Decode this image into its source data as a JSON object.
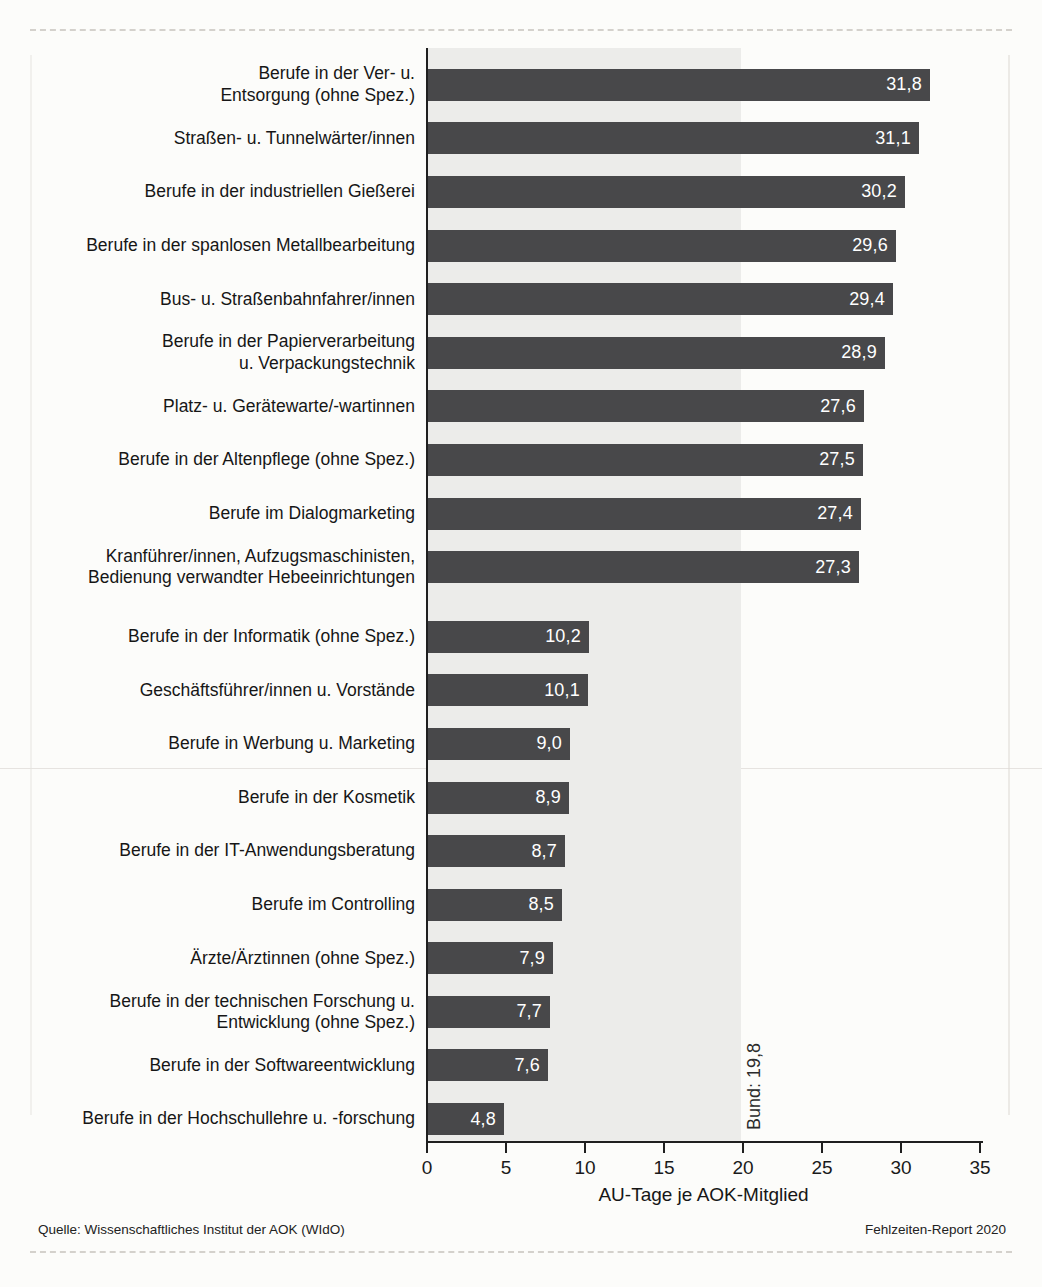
{
  "chart_data": {
    "type": "bar",
    "orientation": "horizontal",
    "title": "",
    "xlabel": "AU-Tage je AOK-Mitglied",
    "ylabel": "",
    "xlim": [
      0,
      35
    ],
    "xticks": [
      "0",
      "5",
      "10",
      "15",
      "20",
      "25",
      "30",
      "35"
    ],
    "grid": false,
    "legend": null,
    "bar_color": "#48484a",
    "band_color": "#ececea",
    "reference": {
      "label": "Bund: 19,8",
      "value": 19.8
    },
    "groups": [
      {
        "items": [
          {
            "label": "Berufe in der Ver- u.\nEntsorgung (ohne Spez.)",
            "value": 31.8,
            "display": "31,8"
          },
          {
            "label": "Straßen- u. Tunnelwärter/innen",
            "value": 31.1,
            "display": "31,1"
          },
          {
            "label": "Berufe in der industriellen Gießerei",
            "value": 30.2,
            "display": "30,2"
          },
          {
            "label": "Berufe in der spanlosen Metallbearbeitung",
            "value": 29.6,
            "display": "29,6"
          },
          {
            "label": "Bus- u. Straßenbahnfahrer/innen",
            "value": 29.4,
            "display": "29,4"
          },
          {
            "label": "Berufe in der Papierverarbeitung\nu. Verpackungstechnik",
            "value": 28.9,
            "display": "28,9"
          },
          {
            "label": "Platz- u. Gerätewarte/-wartinnen",
            "value": 27.6,
            "display": "27,6"
          },
          {
            "label": "Berufe in der Altenpflege (ohne Spez.)",
            "value": 27.5,
            "display": "27,5"
          },
          {
            "label": "Berufe im Dialogmarketing",
            "value": 27.4,
            "display": "27,4"
          },
          {
            "label": "Kranführer/innen, Aufzugsmaschinisten,\nBedienung verwandter Hebeeinrichtungen",
            "value": 27.3,
            "display": "27,3"
          }
        ]
      },
      {
        "items": [
          {
            "label": "Berufe in der Informatik (ohne Spez.)",
            "value": 10.2,
            "display": "10,2"
          },
          {
            "label": "Geschäftsführer/innen u. Vorstände",
            "value": 10.1,
            "display": "10,1"
          },
          {
            "label": "Berufe in Werbung u. Marketing",
            "value": 9.0,
            "display": "9,0"
          },
          {
            "label": "Berufe in der Kosmetik",
            "value": 8.9,
            "display": "8,9"
          },
          {
            "label": "Berufe in der IT-Anwendungsberatung",
            "value": 8.7,
            "display": "8,7"
          },
          {
            "label": "Berufe im Controlling",
            "value": 8.5,
            "display": "8,5"
          },
          {
            "label": "Ärzte/Ärztinnen (ohne Spez.)",
            "value": 7.9,
            "display": "7,9"
          },
          {
            "label": "Berufe in der technischen Forschung u.\nEntwicklung (ohne Spez.)",
            "value": 7.7,
            "display": "7,7"
          },
          {
            "label": "Berufe in der Softwareentwicklung",
            "value": 7.6,
            "display": "7,6"
          },
          {
            "label": "Berufe in der Hochschullehre u. -forschung",
            "value": 4.8,
            "display": "4,8"
          }
        ]
      }
    ]
  },
  "footer": {
    "source": "Quelle: Wissenschaftliches Institut der AOK (WIdO)",
    "report": "Fehlzeiten-Report 2020"
  }
}
